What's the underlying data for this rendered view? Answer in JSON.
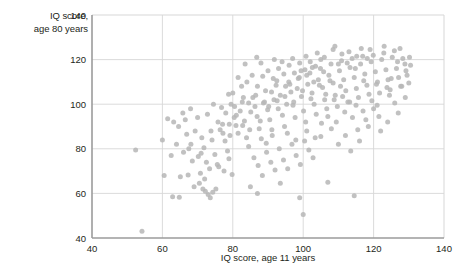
{
  "chart_data": {
    "type": "scatter",
    "title": "",
    "xlabel": "IQ score, age 11 years",
    "ylabel_line1": "IQ score,",
    "ylabel_line2": "age 80 years",
    "ylabel": "IQ score, age 80 years",
    "xlim": [
      40,
      140
    ],
    "ylim": [
      40,
      140
    ],
    "xticks": [
      40,
      60,
      80,
      100,
      120,
      140
    ],
    "yticks": [
      40,
      60,
      80,
      100,
      120,
      140
    ],
    "xtick_labels": [
      "40",
      "60",
      "80",
      "100",
      "120",
      "140"
    ],
    "ytick_labels": [
      "40",
      "60",
      "80",
      "100",
      "120",
      "140"
    ],
    "grid": true,
    "legend": "none",
    "marker": {
      "shape": "circle",
      "color": "#b6b6b6",
      "size": 5,
      "opacity": 0.85
    },
    "colors": {
      "marker": "#b6b6b6",
      "gridline": "#d7d7d7",
      "axis": "#9b9b9b",
      "text": "#231f20",
      "background": "#ffffff"
    },
    "points": [
      [
        52.4,
        79.5
      ],
      [
        54.2,
        43.0
      ],
      [
        60.5,
        68.0
      ],
      [
        62.9,
        58.5
      ],
      [
        64.8,
        58.3
      ],
      [
        60.0,
        84.0
      ],
      [
        61.5,
        93.5
      ],
      [
        63.2,
        92.0
      ],
      [
        64.6,
        90.0
      ],
      [
        65.8,
        96.0
      ],
      [
        66.9,
        86.5
      ],
      [
        68.1,
        82.0
      ],
      [
        69.3,
        88.0
      ],
      [
        65.1,
        67.5
      ],
      [
        67.3,
        68.2
      ],
      [
        70.2,
        76.5
      ],
      [
        71.0,
        78.0
      ],
      [
        71.8,
        80.5
      ],
      [
        72.5,
        74.0
      ],
      [
        70.8,
        69.0
      ],
      [
        72.0,
        66.5
      ],
      [
        73.4,
        71.0
      ],
      [
        74.1,
        84.0
      ],
      [
        74.9,
        77.5
      ],
      [
        75.6,
        73.0
      ],
      [
        73.0,
        59.5
      ],
      [
        73.6,
        58.0
      ],
      [
        74.3,
        60.5
      ],
      [
        75.2,
        62.0
      ],
      [
        72.2,
        61.0
      ],
      [
        76.4,
        88.5
      ],
      [
        77.1,
        91.0
      ],
      [
        77.8,
        83.5
      ],
      [
        78.5,
        79.0
      ],
      [
        79.2,
        86.0
      ],
      [
        76.0,
        72.0
      ],
      [
        77.5,
        70.0
      ],
      [
        78.9,
        75.5
      ],
      [
        79.8,
        68.5
      ],
      [
        80.4,
        94.0
      ],
      [
        80.9,
        90.5
      ],
      [
        81.5,
        87.0
      ],
      [
        82.1,
        97.0
      ],
      [
        82.7,
        101.0
      ],
      [
        83.3,
        92.5
      ],
      [
        83.9,
        85.0
      ],
      [
        84.5,
        81.0
      ],
      [
        85.1,
        96.5
      ],
      [
        85.7,
        103.0
      ],
      [
        86.3,
        99.0
      ],
      [
        86.9,
        94.5
      ],
      [
        87.5,
        89.0
      ],
      [
        88.1,
        84.5
      ],
      [
        88.7,
        100.5
      ],
      [
        89.3,
        106.0
      ],
      [
        89.9,
        97.5
      ],
      [
        90.5,
        93.0
      ],
      [
        91.1,
        88.5
      ],
      [
        91.7,
        102.0
      ],
      [
        92.3,
        108.5
      ],
      [
        92.9,
        98.0
      ],
      [
        93.5,
        104.0
      ],
      [
        94.1,
        95.0
      ],
      [
        94.7,
        90.0
      ],
      [
        95.3,
        100.0
      ],
      [
        95.9,
        110.0
      ],
      [
        96.5,
        105.5
      ],
      [
        97.1,
        99.5
      ],
      [
        97.7,
        94.0
      ],
      [
        98.3,
        107.0
      ],
      [
        98.9,
        112.0
      ],
      [
        99.5,
        103.5
      ],
      [
        100.1,
        97.0
      ],
      [
        100.7,
        92.0
      ],
      [
        101.3,
        109.0
      ],
      [
        101.9,
        114.0
      ],
      [
        102.5,
        105.0
      ],
      [
        103.1,
        100.0
      ],
      [
        103.7,
        95.5
      ],
      [
        104.3,
        111.0
      ],
      [
        104.9,
        116.0
      ],
      [
        105.5,
        107.5
      ],
      [
        106.1,
        102.0
      ],
      [
        106.7,
        98.0
      ],
      [
        107.3,
        113.0
      ],
      [
        107.9,
        118.0
      ],
      [
        108.5,
        109.5
      ],
      [
        109.1,
        104.0
      ],
      [
        109.7,
        99.0
      ],
      [
        110.3,
        115.0
      ],
      [
        110.9,
        119.5
      ],
      [
        111.5,
        111.0
      ],
      [
        112.1,
        106.0
      ],
      [
        112.7,
        101.0
      ],
      [
        113.3,
        116.5
      ],
      [
        113.9,
        120.5
      ],
      [
        114.5,
        112.0
      ],
      [
        115.1,
        107.0
      ],
      [
        115.7,
        103.0
      ],
      [
        116.3,
        118.0
      ],
      [
        116.9,
        121.5
      ],
      [
        117.5,
        113.5
      ],
      [
        118.1,
        108.5
      ],
      [
        118.7,
        104.5
      ],
      [
        119.3,
        119.0
      ],
      [
        119.9,
        122.0
      ],
      [
        120.5,
        114.5
      ],
      [
        121.1,
        110.0
      ],
      [
        121.7,
        105.0
      ],
      [
        122.3,
        120.0
      ],
      [
        122.9,
        123.0
      ],
      [
        123.5,
        115.5
      ],
      [
        124.1,
        111.0
      ],
      [
        124.7,
        106.5
      ],
      [
        125.3,
        121.0
      ],
      [
        125.9,
        124.0
      ],
      [
        126.5,
        116.0
      ],
      [
        127.1,
        112.0
      ],
      [
        127.7,
        108.0
      ],
      [
        128.3,
        120.5
      ],
      [
        128.9,
        118.0
      ],
      [
        129.5,
        113.0
      ],
      [
        130.0,
        109.5
      ],
      [
        126.0,
        100.5
      ],
      [
        127.0,
        96.0
      ],
      [
        120.0,
        98.0
      ],
      [
        121.5,
        94.5
      ],
      [
        118.5,
        90.0
      ],
      [
        114.0,
        94.0
      ],
      [
        115.5,
        88.5
      ],
      [
        112.0,
        86.0
      ],
      [
        108.0,
        89.0
      ],
      [
        105.0,
        85.5
      ],
      [
        110.0,
        82.0
      ],
      [
        113.5,
        79.0
      ],
      [
        116.0,
        83.5
      ],
      [
        122.0,
        88.0
      ],
      [
        124.0,
        92.0
      ],
      [
        129.0,
        103.0
      ],
      [
        130.5,
        117.5
      ],
      [
        84.0,
        110.0
      ],
      [
        85.5,
        113.0
      ],
      [
        87.0,
        108.0
      ],
      [
        88.5,
        112.5
      ],
      [
        90.0,
        115.0
      ],
      [
        91.5,
        111.5
      ],
      [
        93.0,
        116.0
      ],
      [
        94.5,
        113.5
      ],
      [
        96.0,
        117.5
      ],
      [
        97.5,
        114.0
      ],
      [
        99.0,
        118.5
      ],
      [
        100.5,
        115.5
      ],
      [
        102.0,
        119.0
      ],
      [
        103.5,
        117.0
      ],
      [
        105.0,
        120.0
      ],
      [
        86.0,
        76.0
      ],
      [
        87.2,
        72.5
      ],
      [
        88.4,
        68.0
      ],
      [
        89.6,
        78.5
      ],
      [
        90.8,
        74.0
      ],
      [
        92.0,
        70.5
      ],
      [
        93.2,
        80.0
      ],
      [
        94.4,
        75.0
      ],
      [
        95.6,
        71.0
      ],
      [
        96.8,
        82.0
      ],
      [
        98.0,
        77.0
      ],
      [
        99.2,
        73.0
      ],
      [
        100.4,
        83.5
      ],
      [
        101.6,
        79.5
      ],
      [
        102.8,
        76.0
      ],
      [
        85.0,
        63.0
      ],
      [
        87.0,
        60.0
      ],
      [
        93.5,
        64.5
      ],
      [
        99.0,
        58.0
      ],
      [
        107.0,
        65.0
      ],
      [
        100.0,
        50.5
      ],
      [
        114.5,
        59.0
      ],
      [
        81.5,
        112.0
      ],
      [
        80.0,
        105.0
      ],
      [
        82.5,
        108.0
      ],
      [
        79.5,
        100.0
      ],
      [
        78.0,
        96.0
      ],
      [
        80.5,
        99.0
      ],
      [
        83.0,
        103.0
      ],
      [
        81.0,
        95.0
      ],
      [
        84.5,
        100.5
      ],
      [
        86.5,
        104.0
      ],
      [
        89.0,
        101.0
      ],
      [
        91.0,
        105.5
      ],
      [
        95.0,
        108.0
      ],
      [
        104.0,
        123.0
      ],
      [
        106.0,
        121.0
      ],
      [
        108.5,
        124.5
      ],
      [
        111.0,
        122.5
      ],
      [
        116.5,
        125.0
      ],
      [
        119.0,
        124.5
      ],
      [
        123.0,
        126.0
      ],
      [
        127.5,
        125.0
      ],
      [
        109.0,
        126.0
      ],
      [
        113.0,
        123.5
      ],
      [
        100.8,
        121.5
      ],
      [
        97.0,
        120.5
      ],
      [
        94.0,
        119.0
      ],
      [
        91.8,
        120.0
      ],
      [
        88.0,
        118.5
      ],
      [
        69.0,
        63.0
      ],
      [
        70.5,
        64.5
      ],
      [
        71.5,
        62.0
      ],
      [
        67.5,
        80.0
      ],
      [
        68.5,
        74.5
      ],
      [
        66.0,
        78.5
      ],
      [
        64.0,
        82.0
      ],
      [
        62.5,
        77.0
      ],
      [
        66.5,
        93.0
      ],
      [
        68.0,
        98.0
      ],
      [
        70.0,
        94.0
      ],
      [
        72.8,
        95.5
      ],
      [
        74.5,
        100.0
      ],
      [
        76.8,
        98.5
      ],
      [
        78.8,
        104.5
      ],
      [
        75.8,
        92.0
      ],
      [
        77.2,
        87.0
      ],
      [
        79.0,
        91.0
      ],
      [
        73.8,
        88.0
      ],
      [
        71.2,
        85.0
      ],
      [
        83.5,
        118.0
      ],
      [
        86.8,
        121.0
      ],
      [
        92.5,
        110.5
      ],
      [
        96.2,
        109.0
      ],
      [
        98.6,
        111.5
      ],
      [
        101.0,
        113.0
      ],
      [
        103.0,
        110.0
      ],
      [
        105.8,
        114.5
      ],
      [
        107.6,
        110.5
      ],
      [
        110.6,
        108.0
      ],
      [
        112.5,
        118.5
      ],
      [
        114.8,
        116.0
      ],
      [
        117.2,
        110.5
      ],
      [
        120.8,
        109.0
      ],
      [
        123.8,
        107.5
      ],
      [
        89.5,
        82.5
      ],
      [
        91.2,
        86.0
      ],
      [
        84.8,
        88.5
      ],
      [
        82.8,
        90.5
      ],
      [
        87.8,
        92.5
      ],
      [
        90.2,
        99.0
      ],
      [
        92.6,
        101.5
      ],
      [
        94.8,
        103.5
      ],
      [
        97.3,
        101.0
      ],
      [
        99.8,
        106.0
      ],
      [
        102.2,
        102.5
      ],
      [
        104.6,
        108.5
      ],
      [
        106.4,
        104.5
      ],
      [
        108.8,
        102.0
      ],
      [
        111.2,
        103.5
      ],
      [
        113.2,
        101.0
      ],
      [
        115.0,
        99.5
      ],
      [
        117.0,
        97.0
      ],
      [
        119.5,
        101.5
      ],
      [
        121.0,
        99.5
      ],
      [
        95.5,
        87.0
      ],
      [
        97.9,
        84.0
      ],
      [
        101.0,
        88.0
      ],
      [
        103.4,
        85.0
      ],
      [
        105.2,
        91.5
      ],
      [
        107.0,
        94.5
      ],
      [
        109.4,
        92.0
      ],
      [
        111.8,
        96.5
      ],
      [
        117.8,
        93.0
      ],
      [
        125.0,
        111.5
      ],
      [
        124.5,
        104.0
      ],
      [
        128.0,
        108.0
      ],
      [
        130.2,
        121.0
      ],
      [
        129.2,
        115.0
      ],
      [
        126.8,
        119.0
      ],
      [
        118.2,
        120.5
      ],
      [
        115.2,
        121.5
      ],
      [
        110.0,
        118.0
      ],
      [
        102.6,
        116.5
      ],
      [
        99.4,
        115.0
      ]
    ]
  }
}
